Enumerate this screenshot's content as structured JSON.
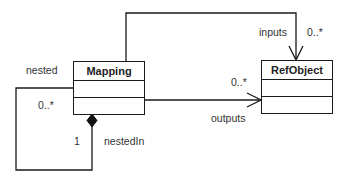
{
  "classes": {
    "mapping": {
      "name": "Mapping"
    },
    "refobject": {
      "name": "RefObject"
    }
  },
  "associations": {
    "inputs": {
      "role": "inputs",
      "multiplicity": "0..*"
    },
    "outputs": {
      "role": "outputs",
      "multiplicity": "0..*"
    },
    "nested": {
      "role": "nested",
      "multiplicity": "0..*"
    },
    "nestedIn": {
      "role": "nestedIn",
      "multiplicity": "1"
    }
  },
  "colors": {
    "line": "#1a1a1a",
    "text": "#333333",
    "background": "#ffffff"
  }
}
